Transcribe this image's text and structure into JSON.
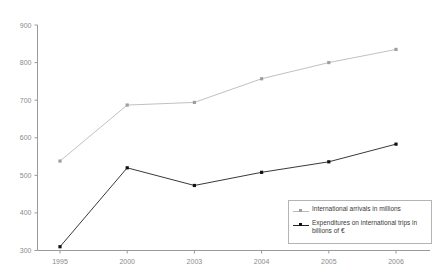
{
  "chart_data": {
    "type": "line",
    "title": "",
    "xlabel": "",
    "ylabel": "",
    "categories": [
      "1995",
      "2000",
      "2003",
      "2004",
      "2005",
      "2006"
    ],
    "ylim": [
      300,
      900
    ],
    "yticks": [
      300,
      400,
      500,
      600,
      700,
      800,
      900
    ],
    "grid": false,
    "legend_position": "bottom-right",
    "series": [
      {
        "name": "International arrivals in millions",
        "color": "#b9b9b9",
        "marker": "square",
        "values": [
          538,
          687,
          694,
          757,
          800,
          835
        ]
      },
      {
        "name": "Expenditures on international trips in billions of €",
        "color": "#222222",
        "marker": "square",
        "values": [
          310,
          520,
          473,
          508,
          536,
          583
        ]
      }
    ]
  },
  "axis": {
    "y_tick_labels": [
      "900",
      "800",
      "700",
      "600",
      "500",
      "400",
      "300"
    ],
    "x_tick_labels": [
      "1995",
      "2000",
      "2003",
      "2004",
      "2005",
      "2006"
    ],
    "axis_color": "#9a9a9a",
    "tick_label_color": "#8a8a8a"
  },
  "legend": {
    "entries": [
      {
        "label": "International arrivals in millions",
        "color": "#b9b9b9"
      },
      {
        "label": "Expenditures on international trips in billions of €",
        "color": "#222222"
      }
    ]
  }
}
